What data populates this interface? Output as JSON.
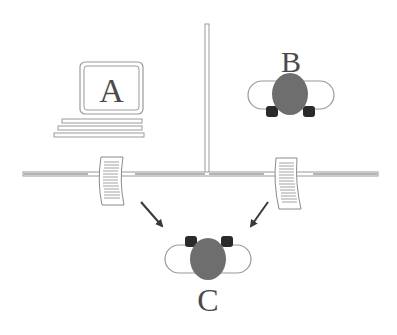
{
  "diagram": {
    "type": "network-message-passing",
    "nodes": {
      "A": {
        "label": "A",
        "kind": "computer-terminal"
      },
      "B": {
        "label": "B",
        "kind": "person-at-desk-top-view"
      },
      "C": {
        "label": "C",
        "kind": "person-at-desk-top-view"
      }
    },
    "documents": [
      {
        "id": "doc-left",
        "kind": "paper-message"
      },
      {
        "id": "doc-right",
        "kind": "paper-message"
      }
    ],
    "arrows": [
      {
        "from": "doc-left",
        "to": "C"
      },
      {
        "from": "doc-right",
        "to": "C"
      }
    ],
    "colors": {
      "line": "#9a9a9a",
      "line_light": "#d8d8d8",
      "head": "#6e6e6e",
      "foot": "#2a2a2a",
      "arrow": "#3a3a3a",
      "text": "#4a4a4a"
    }
  }
}
